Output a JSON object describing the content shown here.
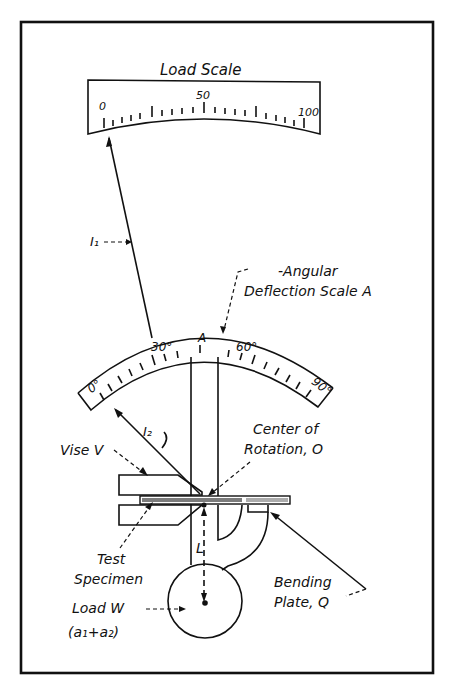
{
  "diagram": {
    "title": "Load Scale",
    "load_scale": {
      "label": "Load Scale",
      "ticks": [
        "0",
        "50",
        "100"
      ]
    },
    "angular_scale": {
      "label_line1": "-Angular",
      "label_line2": "Deflection Scale A",
      "ticks": [
        "0°",
        "30°",
        "A",
        "60°",
        "90°"
      ]
    },
    "labels": {
      "i1": "I₁",
      "i2": "I₂",
      "vise": "Vise V",
      "center_line1": "Center of",
      "center_line2": "Rotation, O",
      "test_line1": "Test",
      "test_line2": "Specimen",
      "load_line1": "Load W",
      "load_line2": "(a₁+a₂)",
      "length": "L",
      "bending_line1": "Bending",
      "bending_line2": "Plate, Q"
    },
    "colors": {
      "ink": "#111111",
      "background": "#ffffff"
    }
  }
}
